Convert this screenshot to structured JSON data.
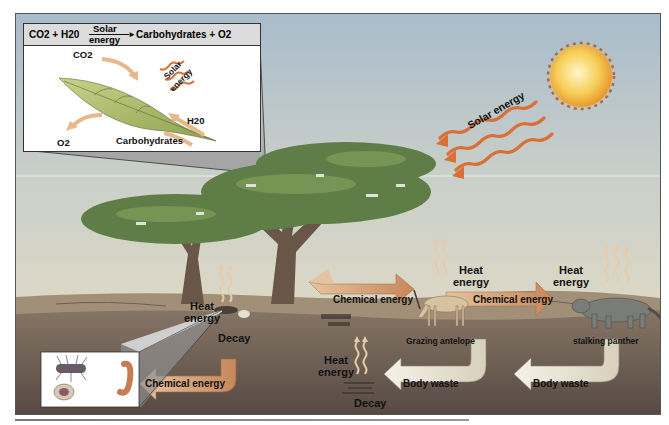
{
  "diagram": {
    "inset_photosynthesis": {
      "equation": {
        "reactants": "CO2 + H20",
        "arrow_top": "Solar",
        "arrow_bottom": "energy",
        "products": "Carbohydrates + O2"
      },
      "labels": {
        "co2": "CO2",
        "solar_line1": "Solar",
        "solar_line2": "energy",
        "h2o": "H20",
        "o2": "O2",
        "carbohydrates": "Carbohydrates"
      }
    },
    "sun": {
      "label": "Solar energy"
    },
    "flows": {
      "chemical_energy_tree_to_antelope": "Chemical energy",
      "chemical_energy_antelope_to_panther": "Chemical energy",
      "chemical_energy_decomposers": "Chemical energy",
      "body_waste_antelope": "Body waste",
      "body_waste_panther": "Body waste"
    },
    "heat_labels": {
      "tree": {
        "line1": "Heat",
        "line2": "energy"
      },
      "antelope": {
        "line1": "Heat",
        "line2": "energy"
      },
      "panther": {
        "line1": "Heat",
        "line2": "energy"
      },
      "soil": {
        "line1": "Heat",
        "line2": "energy"
      }
    },
    "decay_labels": {
      "tree_decay": "Decay",
      "soil_decay": "Decay"
    },
    "organisms": {
      "antelope": "Grazing antelope",
      "panther": "stalking panther"
    },
    "colors": {
      "sky_top": "#aebfcb",
      "sky_bottom": "#d9d6c6",
      "ground": "#9a8a74",
      "soil": "#6e5e53",
      "tree_canopy": "#5f7d46",
      "trunk": "#6a5648",
      "sun": "#f5c040",
      "solar_arrow": "#e07a3a",
      "chem_arrow": "#d8a878",
      "waste_arrow": "#ece6d8",
      "leaf": "#a7b86a",
      "heat": "#e8c8a0"
    }
  }
}
